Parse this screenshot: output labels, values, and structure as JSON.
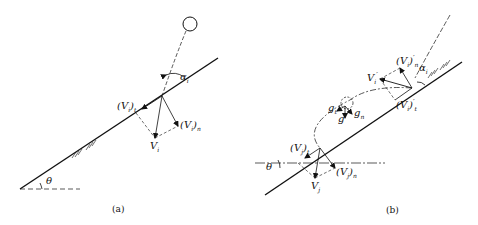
{
  "panel_a": {
    "caption": "(a)",
    "labels": {
      "alpha": "α",
      "alpha_sub": "i",
      "vt": "(V",
      "vt_sub": "i",
      "vt_end": ")",
      "vt_sub2": "t",
      "vn": "(V",
      "vn_sub": "i",
      "vn_end": ")",
      "vn_sub2": "n",
      "v": "V",
      "v_sub": "i",
      "theta": "θ"
    }
  },
  "panel_b": {
    "caption": "(b)",
    "labels": {
      "alpha": "α",
      "alpha_sub": "i",
      "vn_prime": "(V",
      "vn_prime_sub": "i",
      "vn_prime_end": ")",
      "vn_prime_sub2": "n",
      "vn_prime_mark": "′",
      "v_prime": "V",
      "v_prime_sub": "i",
      "v_prime_mark": "′",
      "vt_prime": "(V",
      "vt_prime_sub": "i",
      "vt_prime_end": ")",
      "vt_prime_sub2": "t",
      "vt_prime_mark": "′",
      "gt": "g",
      "gt_sub": "t",
      "gn": "g",
      "gn_sub": "n",
      "g": "g",
      "vjt": "(V",
      "vjt_sub": "j",
      "vjt_end": ")",
      "vjt_sub2": "t",
      "vjn": "(V",
      "vjn_sub": "j",
      "vjn_end": ")",
      "vjn_sub2": "n",
      "vj": "V",
      "vj_sub": "j",
      "theta": "θ"
    }
  }
}
